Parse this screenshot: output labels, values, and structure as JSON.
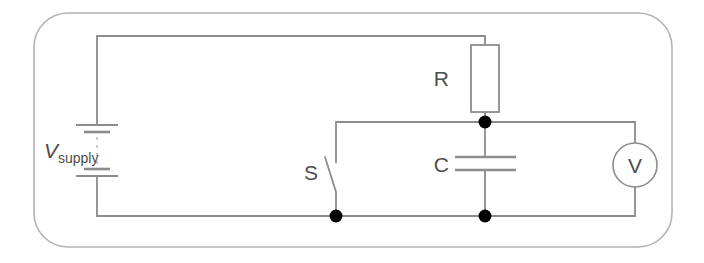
{
  "figure": {
    "name": "rc-charging-circuit-diagram",
    "kind": "schematic",
    "width": 704,
    "height": 263,
    "background_color": "#ffffff",
    "frame": {
      "name": "rounded-frame",
      "stroke_color": "#b3b3b3",
      "corner_radius": 34
    },
    "wire_color": "#8c8c8c",
    "node_color": "#000000",
    "label_color": "#4d4d4d"
  },
  "components": {
    "supply": {
      "label_symbol": "V",
      "label_subscript": "supply",
      "type": "battery-multi-cell"
    },
    "resistor": {
      "label": "R",
      "type": "resistor-box"
    },
    "capacitor": {
      "label": "C",
      "type": "capacitor-parallel-plate"
    },
    "switch": {
      "label": "S",
      "type": "switch-open"
    },
    "voltmeter": {
      "label": "V",
      "type": "meter-circle"
    }
  }
}
